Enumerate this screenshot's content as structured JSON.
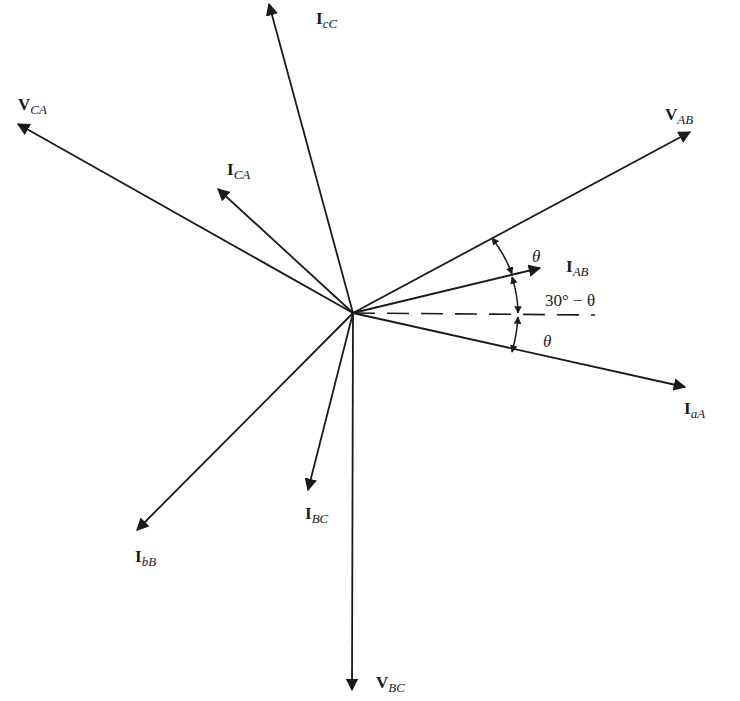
{
  "diagram": {
    "origin": [
      353,
      313
    ],
    "stroke_color": "#1a1a1a",
    "phasors": [
      {
        "id": "V_AB",
        "main": "V",
        "sub": "AB",
        "end": [
          690,
          132
        ],
        "label_pos": [
          665,
          106
        ]
      },
      {
        "id": "V_CA",
        "main": "V",
        "sub": "CA",
        "end": [
          18,
          124
        ],
        "label_pos": [
          18,
          96
        ]
      },
      {
        "id": "V_BC",
        "main": "V",
        "sub": "BC",
        "end": [
          352,
          690
        ],
        "label_pos": [
          376,
          674
        ]
      },
      {
        "id": "I_cC",
        "main": "I",
        "sub": "cC",
        "end": [
          269,
          4
        ],
        "label_pos": [
          316,
          10
        ]
      },
      {
        "id": "I_CA",
        "main": "I",
        "sub": "CA",
        "end": [
          218,
          189
        ],
        "label_pos": [
          227,
          161
        ]
      },
      {
        "id": "I_AB",
        "main": "I",
        "sub": "AB",
        "end": [
          540,
          268
        ],
        "label_pos": [
          566,
          258
        ]
      },
      {
        "id": "I_aA",
        "main": "I",
        "sub": "aA",
        "end": [
          685,
          387
        ],
        "label_pos": [
          684,
          400
        ]
      },
      {
        "id": "I_BC",
        "main": "I",
        "sub": "BC",
        "end": [
          308,
          490
        ],
        "label_pos": [
          305,
          505
        ]
      },
      {
        "id": "I_bB",
        "main": "I",
        "sub": "bB",
        "end": [
          137,
          530
        ],
        "label_pos": [
          135,
          548
        ]
      }
    ],
    "reference_line": {
      "from": [
        353,
        313
      ],
      "to": [
        595,
        315
      ],
      "style": "dashed"
    },
    "angle_annotations": [
      {
        "text": "θ",
        "pos": [
          532,
          248
        ],
        "italic": true
      },
      {
        "text": "30° − θ",
        "pos": [
          545,
          292
        ],
        "italic": false
      },
      {
        "text": "θ",
        "pos": [
          543,
          333
        ],
        "italic": true
      }
    ]
  }
}
